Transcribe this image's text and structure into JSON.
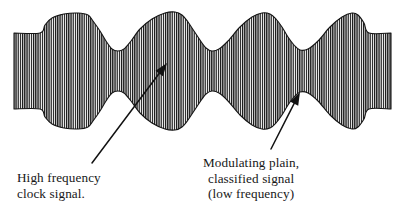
{
  "figure": {
    "name": "modulated-signal-waveform",
    "background_color": "#ffffff",
    "ink_color": "#1a1a1a",
    "hatch": {
      "description": "vertical line hatching filling the waveform envelope",
      "stripe_pitch_px": 2.2,
      "stripe_width_px": 1.2,
      "stripe_color": "#111111",
      "gap_color": "#ffffff"
    }
  },
  "annotations": [
    {
      "id": "clock-signal",
      "lines": [
        "High frequency",
        "clock signal."
      ],
      "align": "left",
      "arrow": {
        "from_x": 92,
        "from_y": 163,
        "to_x": 167,
        "to_y": 63
      }
    },
    {
      "id": "modulating-signal",
      "lines": [
        "Modulating plain,",
        "classified signal",
        "(low frequency)"
      ],
      "align": "center",
      "arrow": {
        "from_x": 271,
        "from_y": 149,
        "to_x": 300,
        "to_y": 92
      }
    }
  ],
  "chart_data": {
    "type": "area",
    "title": "",
    "subtitle": "",
    "xlabel": "",
    "ylabel": "",
    "grid": false,
    "legend_position": "none",
    "axis_center_y": 71,
    "xlim": [
      14,
      391
    ],
    "envelope": {
      "x": [
        14,
        40,
        45,
        52,
        64,
        78,
        88,
        93,
        100,
        106,
        112,
        118,
        124,
        131,
        140,
        152,
        165,
        175,
        182,
        188,
        194,
        200,
        206,
        212,
        219,
        228,
        240,
        252,
        262,
        270,
        276,
        282,
        288,
        294,
        300,
        308,
        318,
        330,
        342,
        352,
        358,
        364,
        369,
        391
      ],
      "half_amplitude": [
        38,
        38,
        46,
        53,
        57,
        58,
        56,
        50,
        40,
        30,
        22,
        20,
        22,
        30,
        42,
        52,
        58,
        59,
        56,
        49,
        40,
        31,
        23,
        20,
        22,
        30,
        44,
        54,
        58,
        57,
        52,
        44,
        34,
        26,
        21,
        22,
        30,
        44,
        54,
        58,
        56,
        48,
        38,
        38
      ]
    },
    "lobes": [
      {
        "center_x": 65,
        "top_y": 13,
        "bottom_y": 129,
        "peak_half_amplitude": 58
      },
      {
        "center_x": 155,
        "top_y": 12,
        "bottom_y": 130,
        "peak_half_amplitude": 59
      },
      {
        "center_x": 245,
        "top_y": 13,
        "bottom_y": 129,
        "peak_half_amplitude": 58
      },
      {
        "center_x": 337,
        "top_y": 13,
        "bottom_y": 129,
        "peak_half_amplitude": 58
      }
    ],
    "waists": [
      {
        "center_x": 112,
        "half_amplitude": 20
      },
      {
        "center_x": 212,
        "half_amplitude": 20
      },
      {
        "center_x": 300,
        "half_amplitude": 21
      }
    ],
    "flat_ends": [
      {
        "side": "left",
        "x_start": 14,
        "x_end": 41,
        "half_amplitude": 38
      },
      {
        "side": "right",
        "x_start": 366,
        "x_end": 391,
        "half_amplitude": 38
      }
    ]
  }
}
